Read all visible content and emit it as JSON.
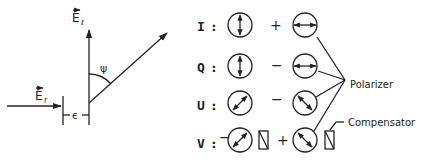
{
  "left_diagram": {
    "vector_labels": {
      "e_l": "E",
      "e_l_sub": "ℓ",
      "e_r": "E",
      "e_r_sub": "r"
    },
    "angle_label": "ψ",
    "offset_label": "ϵ"
  },
  "right_diagram": {
    "rows": [
      {
        "param": "I",
        "colon": ":",
        "lead_sign": "",
        "operator": "+",
        "first_orientation": "vertical",
        "second_orientation": "horizontal",
        "compensator": false
      },
      {
        "param": "Q",
        "colon": ":",
        "lead_sign": "",
        "operator": "−",
        "first_orientation": "vertical",
        "second_orientation": "horizontal",
        "compensator": false
      },
      {
        "param": "U",
        "colon": ":",
        "lead_sign": "",
        "operator": "−",
        "first_orientation": "diagonal-45",
        "second_orientation": "diagonal-135",
        "compensator": false
      },
      {
        "param": "V",
        "colon": ":",
        "lead_sign": "−",
        "operator": "+",
        "first_orientation": "diagonal-45",
        "second_orientation": "diagonal-135",
        "compensator": true
      }
    ],
    "annotations": {
      "polarizer": "Polarizer",
      "compensator": "Compensator"
    }
  }
}
